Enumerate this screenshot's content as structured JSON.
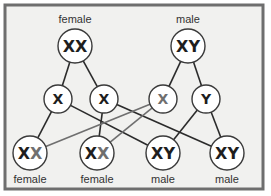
{
  "colors": {
    "background": "#f1f1ef",
    "frame": "#6e6e6e",
    "circle_fill": "#ffffff",
    "circle_stroke": "#3a3a3a",
    "maternal_line": "#2b2b2b",
    "paternal_x_line": "#6f6f6f",
    "maternal_letter": "#1e1e1e",
    "paternal_x_letter": "#6f6f6f",
    "paternal_y_letter": "#1e1e1e"
  },
  "parents": [
    {
      "id": "mother",
      "label": "female",
      "chromosomes": [
        {
          "letter": "X",
          "origin": "maternal"
        },
        {
          "letter": "X",
          "origin": "maternal"
        }
      ],
      "cx": 75,
      "cy": 46,
      "r": 17
    },
    {
      "id": "father",
      "label": "male",
      "chromosomes": [
        {
          "letter": "X",
          "origin": "maternal"
        },
        {
          "letter": "Y",
          "origin": "maternal"
        }
      ],
      "cx": 188,
      "cy": 46,
      "r": 17
    }
  ],
  "gametes": [
    {
      "id": "g1",
      "letter": "X",
      "origin": "maternal",
      "parent": "mother",
      "cx": 58,
      "cy": 99,
      "r": 14
    },
    {
      "id": "g2",
      "letter": "X",
      "origin": "maternal",
      "parent": "mother",
      "cx": 104,
      "cy": 99,
      "r": 14
    },
    {
      "id": "g3",
      "letter": "X",
      "origin": "paternal_x",
      "parent": "father",
      "cx": 163,
      "cy": 99,
      "r": 14
    },
    {
      "id": "g4",
      "letter": "Y",
      "origin": "paternal_y",
      "parent": "father",
      "cx": 206,
      "cy": 99,
      "r": 14
    }
  ],
  "offspring": [
    {
      "id": "o1",
      "label": "female",
      "chromosomes": [
        {
          "letter": "X",
          "origin": "maternal"
        },
        {
          "letter": "X",
          "origin": "paternal_x"
        }
      ],
      "cx": 30,
      "cy": 153,
      "r": 17
    },
    {
      "id": "o2",
      "label": "female",
      "chromosomes": [
        {
          "letter": "X",
          "origin": "maternal"
        },
        {
          "letter": "X",
          "origin": "paternal_x"
        }
      ],
      "cx": 97,
      "cy": 153,
      "r": 17
    },
    {
      "id": "o3",
      "label": "male",
      "chromosomes": [
        {
          "letter": "X",
          "origin": "maternal"
        },
        {
          "letter": "Y",
          "origin": "paternal_y"
        }
      ],
      "cx": 163,
      "cy": 153,
      "r": 17
    },
    {
      "id": "o4",
      "label": "male",
      "chromosomes": [
        {
          "letter": "X",
          "origin": "maternal"
        },
        {
          "letter": "Y",
          "origin": "paternal_y"
        }
      ],
      "cx": 227,
      "cy": 153,
      "r": 17
    }
  ],
  "edges": [
    {
      "from": "mother",
      "to": "g1",
      "style": "maternal"
    },
    {
      "from": "mother",
      "to": "g2",
      "style": "maternal"
    },
    {
      "from": "father",
      "to": "g3",
      "style": "maternal"
    },
    {
      "from": "father",
      "to": "g4",
      "style": "maternal"
    },
    {
      "from": "g1",
      "to": "o1",
      "style": "maternal"
    },
    {
      "from": "g1",
      "to": "o3",
      "style": "maternal"
    },
    {
      "from": "g2",
      "to": "o2",
      "style": "maternal"
    },
    {
      "from": "g2",
      "to": "o4",
      "style": "maternal"
    },
    {
      "from": "g3",
      "to": "o1",
      "style": "paternal_x"
    },
    {
      "from": "g3",
      "to": "o2",
      "style": "paternal_x"
    },
    {
      "from": "g4",
      "to": "o3",
      "style": "maternal"
    },
    {
      "from": "g4",
      "to": "o4",
      "style": "maternal"
    }
  ]
}
